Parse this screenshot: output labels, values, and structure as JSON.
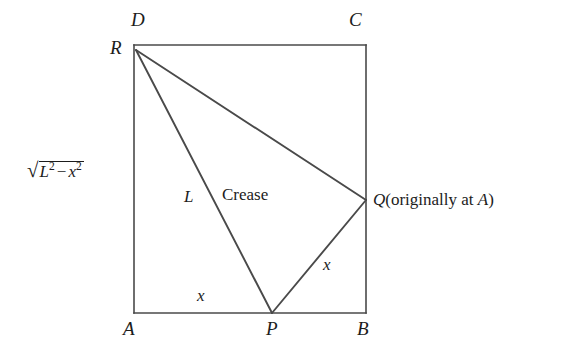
{
  "figure": {
    "type": "geometry-diagram",
    "background_color": "#ffffff",
    "line_color": "#4a4a4a",
    "text_color": "#1c1c1c"
  },
  "vertices": {
    "A": {
      "label": "A",
      "x": 134,
      "y": 313
    },
    "B": {
      "label": "B",
      "x": 366,
      "y": 313
    },
    "C": {
      "label": "C",
      "x": 366,
      "y": 45
    },
    "D": {
      "label": "D",
      "x": 134,
      "y": 45
    },
    "P": {
      "label": "P",
      "x": 272,
      "y": 313
    },
    "Q": {
      "label": "Q",
      "x": 366,
      "y": 200
    },
    "R": {
      "label": "R",
      "x": 136,
      "y": 50
    }
  },
  "labels": {
    "D": "D",
    "C": "C",
    "R": "R",
    "A": "A",
    "P": "P",
    "B": "B",
    "crease": "Crease",
    "L": "L",
    "x_bottom": "x",
    "x_right": "x",
    "sqrt": {
      "radical_sign": "√",
      "base1": "L",
      "exp1": "2",
      "operator": "−",
      "base2": "x",
      "exp2": "2",
      "plain_text": "√(L² − x²)"
    },
    "q_note": {
      "symbol": "Q",
      "open_paren": "(originally at ",
      "reference": "A",
      "close_paren": ")",
      "plain_text": "Q (originally at A)"
    }
  },
  "segments": [
    {
      "name": "rectangle-top-DC",
      "from": "D",
      "to": "C"
    },
    {
      "name": "rectangle-right-CB",
      "from": "C",
      "to": "B"
    },
    {
      "name": "rectangle-bottom-AB",
      "from": "A",
      "to": "B"
    },
    {
      "name": "rectangle-left-DA",
      "from": "D",
      "to": "A"
    },
    {
      "name": "crease-RP",
      "from": "R",
      "to": "P",
      "length_label": "L"
    },
    {
      "name": "fold-edge-RQ",
      "from": "R",
      "to": "Q"
    },
    {
      "name": "fold-edge-PQ",
      "from": "P",
      "to": "Q",
      "length_label": "x"
    }
  ],
  "measurements": [
    {
      "name": "segment-AP",
      "label": "x"
    },
    {
      "name": "segment-PQ",
      "label": "x"
    },
    {
      "name": "segment-RP-crease",
      "label": "L"
    },
    {
      "name": "segment-AR-vertical",
      "label": "√(L² − x²)"
    }
  ]
}
